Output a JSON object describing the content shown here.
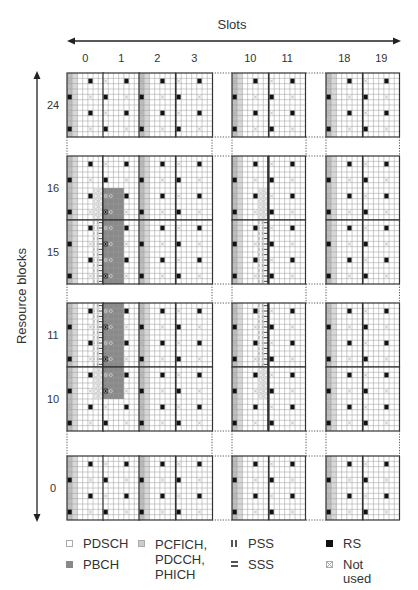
{
  "title": "Slots",
  "y_axis_label": "Resource blocks",
  "slots": [
    "0",
    "1",
    "2",
    "3",
    "10",
    "11",
    "18",
    "19"
  ],
  "resource_blocks": [
    "24",
    "16",
    "15",
    "11",
    "10",
    "0"
  ],
  "geometry": {
    "slot_x": [
      67,
      103,
      139,
      176,
      232,
      269,
      326,
      363
    ],
    "slot_w": 36.5,
    "rb_y": [
      73,
      156,
      220,
      303,
      367,
      456
    ],
    "rb_h": 64,
    "symbols_per_slot": 7,
    "subcarriers_per_rb": 12
  },
  "legend": [
    {
      "key": "pdsch",
      "label": "PDSCH",
      "swatch": "#ffffff",
      "border": "#aaaaaa"
    },
    {
      "key": "pcfich",
      "label": "PCFICH,\nPDCCH,\nPHICH",
      "swatch": "#cccccc",
      "border": "#aaaaaa"
    },
    {
      "key": "pss",
      "label": "PSS",
      "swatch": "pss"
    },
    {
      "key": "rs",
      "label": "RS",
      "swatch": "#111111"
    },
    {
      "key": "pbch",
      "label": "PBCH",
      "swatch": "#888888"
    },
    {
      "key": "sss",
      "label": "SSS",
      "swatch": "sss"
    },
    {
      "key": "notused",
      "label": "Not used",
      "swatch": "notused"
    }
  ],
  "colors": {
    "grid_line": "#999999",
    "block_border": "#333333",
    "control": "#c8c8c8",
    "pbch": "#8a8a8a",
    "rs": "#111111",
    "text": "#333333"
  }
}
